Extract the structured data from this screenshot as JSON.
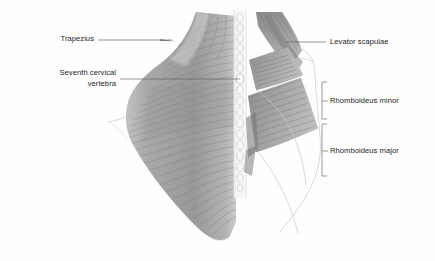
{
  "figure": {
    "view": "posterior",
    "background_color": "#fefefe",
    "width": 435,
    "height": 261
  },
  "labels": {
    "trapezius": "Trapezius",
    "seventh_cervical_vertebra": "Seventh cervical\nvertebra",
    "levator_scapulae": "Levator scapulae",
    "rhomboideus_minor": "Rhomboideus minor",
    "rhomboideus_major": "Rhomboideus major"
  },
  "structures": [
    {
      "name": "trapezius",
      "label": "Trapezius",
      "side": "left",
      "fiber_direction": "horizontal-fanning",
      "color": "#9d9d9d"
    },
    {
      "name": "vertebral-column",
      "label": "Seventh cervical vertebra",
      "side": "center",
      "color": "#e9e9e9"
    },
    {
      "name": "levator-scapulae",
      "label": "Levator scapulae",
      "side": "right",
      "fiber_direction": "oblique",
      "color": "#8d8d8d"
    },
    {
      "name": "rhomboideus-minor",
      "label": "Rhomboideus minor",
      "side": "right",
      "fiber_direction": "oblique",
      "color": "#9a9a9a"
    },
    {
      "name": "rhomboideus-major",
      "label": "Rhomboideus major",
      "side": "right",
      "fiber_direction": "oblique",
      "color": "#9a9a9a"
    }
  ],
  "colors": {
    "muscle_light": "#b4b4b4",
    "muscle_mid": "#9a9a9a",
    "muscle_dark": "#6f6f6f",
    "striation": "#7b7b7b",
    "bone": "#ededed",
    "bone_outline": "#bdbdbd",
    "leader_line": "#6a6a6a",
    "text": "#1d1d1d"
  }
}
